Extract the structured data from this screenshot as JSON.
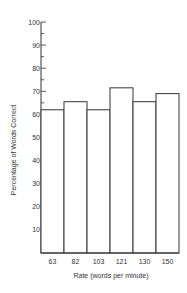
{
  "chart_data": {
    "type": "bar",
    "title": "",
    "xlabel": "Rate (words per minute)",
    "ylabel": "Percentage of Words Correct",
    "categories": [
      "63",
      "82",
      "103",
      "121",
      "130",
      "150"
    ],
    "values": [
      62,
      65.5,
      62,
      71.5,
      65.5,
      69
    ],
    "ylim": [
      0,
      100
    ],
    "yticks": [
      10,
      20,
      30,
      40,
      50,
      60,
      70,
      80,
      90,
      100
    ],
    "minor_ticks_between": true,
    "grid": false,
    "legend": null,
    "colors": {
      "bar_fill": "#ffffff",
      "bar_stroke": "#333333",
      "axis": "#333333"
    }
  }
}
